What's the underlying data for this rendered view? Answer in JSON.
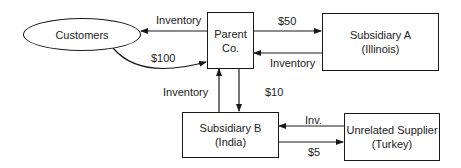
{
  "nodes": {
    "customers": {
      "label": "Customers"
    },
    "parent": {
      "line1": "Parent",
      "line2": "Co."
    },
    "sub_a": {
      "line1": "Subsidiary A",
      "line2": "(Illinois)"
    },
    "sub_b": {
      "line1": "Subsidiary B",
      "line2": "(India)"
    },
    "supplier": {
      "line1": "Unrelated Supplier",
      "line2": "(Turkey)"
    }
  },
  "edges": {
    "parent_to_customers": "Inventory",
    "customers_to_parent": "$100",
    "parent_to_sub_a": "$50",
    "sub_a_to_parent": "Inventory",
    "sub_b_to_parent": "Inventory",
    "parent_to_sub_b": "$10",
    "supplier_to_sub_b": "Inv.",
    "sub_b_to_supplier": "$5"
  },
  "colors": {
    "stroke": "#1a1a1a",
    "background": "#ffffff"
  }
}
